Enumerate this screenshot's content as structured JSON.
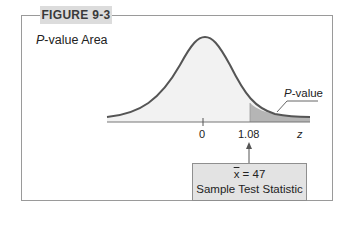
{
  "figure": {
    "label": "FIGURE 9-3",
    "subtitle_italic": "P",
    "subtitle_rest": "-value Area"
  },
  "plot": {
    "curve": "standard-normal",
    "shaded_region_label_italic": "P",
    "shaded_region_label_rest": "-value",
    "x_ticks": [
      "0",
      "1.08"
    ],
    "x_axis_label": "z",
    "colors": {
      "curve": "#555555",
      "fill": "#f2f2f2",
      "shaded": "#b5b5b5",
      "axis": "#777777"
    }
  },
  "stat_box": {
    "line1_var": "x",
    "line1_rest": " = 47",
    "line2": "Sample Test Statistic"
  }
}
